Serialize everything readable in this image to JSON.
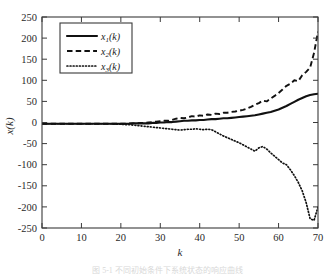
{
  "figure": {
    "caption_partial": "图 5-1  不同初始条件下系统状态的响应曲线"
  },
  "chart_data": {
    "type": "line",
    "title": "",
    "xlabel": "k",
    "ylabel": "x(k)",
    "xlim": [
      0,
      70
    ],
    "ylim": [
      -250,
      250
    ],
    "xticks": [
      0,
      10,
      20,
      30,
      40,
      50,
      60,
      70
    ],
    "yticks": [
      -250,
      -200,
      -150,
      -100,
      -50,
      0,
      50,
      100,
      150,
      200,
      250
    ],
    "xtick_labels": [
      "0",
      "10",
      "20",
      "30",
      "40",
      "50",
      "60",
      "70"
    ],
    "ytick_labels": [
      "250",
      "200",
      "150",
      "100",
      "50",
      "0",
      "-50",
      "-100",
      "-150",
      "-200",
      "-250"
    ],
    "grid": false,
    "box": true,
    "tick_direction": "in",
    "legend_position": "upper-left",
    "legend": [
      {
        "label": "x1(k)",
        "base": "x",
        "sub": "1",
        "tail": "(k)",
        "style": "solid"
      },
      {
        "label": "x2(k)",
        "base": "x",
        "sub": "2",
        "tail": "(k)",
        "style": "dashed"
      },
      {
        "label": "x3(k)",
        "base": "x",
        "sub": "3",
        "tail": "(k)",
        "style": "dotted"
      }
    ],
    "x": [
      0,
      1,
      2,
      3,
      4,
      5,
      6,
      7,
      8,
      9,
      10,
      11,
      12,
      13,
      14,
      15,
      16,
      17,
      18,
      19,
      20,
      21,
      22,
      23,
      24,
      25,
      26,
      27,
      28,
      29,
      30,
      31,
      32,
      33,
      34,
      35,
      36,
      37,
      38,
      39,
      40,
      41,
      42,
      43,
      44,
      45,
      46,
      47,
      48,
      49,
      50,
      51,
      52,
      53,
      54,
      55,
      56,
      57,
      58,
      59,
      60,
      61,
      62,
      63,
      64,
      65,
      66,
      67,
      68,
      69,
      70
    ],
    "series": [
      {
        "name": "x1(k)",
        "style": "solid",
        "values": [
          -3,
          -3,
          -3,
          -3,
          -3,
          -3,
          -3,
          -3,
          -3,
          -3,
          -3,
          -3,
          -3,
          -3,
          -3,
          -3,
          -3,
          -3,
          -3,
          -3,
          -3,
          -3,
          -3,
          -2,
          -2,
          -2,
          -2,
          -2,
          -1,
          -1,
          0,
          0,
          1,
          1,
          2,
          3,
          4,
          4,
          5,
          5,
          6,
          6,
          7,
          8,
          8,
          9,
          10,
          10,
          11,
          12,
          13,
          14,
          15,
          16,
          17,
          19,
          21,
          23,
          25,
          28,
          31,
          35,
          39,
          44,
          49,
          54,
          58,
          62,
          65,
          67,
          68
        ]
      },
      {
        "name": "x2(k)",
        "style": "dashed",
        "values": [
          -3,
          -3,
          -3,
          -3,
          -3,
          -3,
          -3,
          -3,
          -3,
          -3,
          -3,
          -3,
          -3,
          -3,
          -3,
          -3,
          -3,
          -3,
          -3,
          -3,
          -3,
          -3,
          -2,
          -2,
          -2,
          -1,
          -1,
          0,
          1,
          2,
          3,
          4,
          4,
          6,
          9,
          11,
          10,
          12,
          15,
          14,
          17,
          16,
          19,
          18,
          21,
          20,
          23,
          23,
          25,
          26,
          28,
          30,
          33,
          37,
          42,
          46,
          52,
          50,
          57,
          63,
          70,
          78,
          87,
          92,
          100,
          98,
          112,
          120,
          130,
          165,
          215
        ]
      },
      {
        "name": "x3(k)",
        "style": "dotted",
        "values": [
          -3,
          -3,
          -3,
          -3,
          -3,
          -3,
          -3,
          -3,
          -3,
          -3,
          -3,
          -3,
          -3,
          -3,
          -3,
          -3,
          -3,
          -3,
          -3,
          -4,
          -4,
          -5,
          -5,
          -6,
          -7,
          -8,
          -9,
          -10,
          -11,
          -12,
          -13,
          -14,
          -15,
          -16,
          -17,
          -18,
          -17,
          -16,
          -16,
          -15,
          -16,
          -17,
          -16,
          -17,
          -22,
          -27,
          -32,
          -36,
          -40,
          -44,
          -48,
          -53,
          -58,
          -63,
          -68,
          -60,
          -57,
          -63,
          -72,
          -80,
          -88,
          -96,
          -100,
          -112,
          -126,
          -142,
          -162,
          -190,
          -228,
          -232,
          -200
        ]
      }
    ]
  }
}
